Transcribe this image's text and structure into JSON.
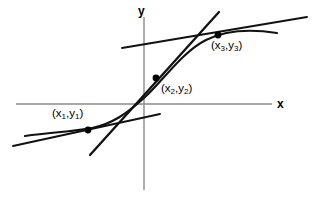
{
  "figure": {
    "width": 317,
    "height": 198,
    "background_color": "#ffffff"
  },
  "axes": {
    "x_axis": {
      "label": "x",
      "label_icon": "x-axis-label",
      "color": "#8b8b8b",
      "y_pixel": 104,
      "x_start": 16,
      "x_end": 272
    },
    "y_axis": {
      "label": "y",
      "label_icon": "y-axis-label",
      "color": "#8b8b8b",
      "x_pixel": 144,
      "y_start": 17,
      "y_end": 190
    }
  },
  "points": [
    {
      "id": "p1",
      "label_prefix": "(x",
      "label_sub1": "1",
      "label_mid": ",y",
      "label_sub2": "1",
      "label_suffix": ")",
      "label_text": "(x1,y1)",
      "cx": 88,
      "cy": 130,
      "r": 3.4
    },
    {
      "id": "p2",
      "label_prefix": "(x",
      "label_sub1": "2",
      "label_mid": ",y",
      "label_sub2": "2",
      "label_suffix": ")",
      "label_text": "(x2,y2)",
      "cx": 156,
      "cy": 78,
      "r": 3.4
    },
    {
      "id": "p3",
      "label_prefix": "(x",
      "label_sub1": "3",
      "label_mid": ",y",
      "label_sub2": "3",
      "label_suffix": ")",
      "label_text": "(x3,y3)",
      "cx": 218,
      "cy": 35,
      "r": 3.4
    }
  ],
  "chart_data": {
    "type": "line",
    "title": "",
    "xlabel": "x",
    "ylabel": "y",
    "grid": false,
    "legend": "none",
    "origin_pixel": [
      144,
      104
    ],
    "series": [
      {
        "name": "curve",
        "kind": "sigmoid-curve",
        "color": "#111111",
        "stroke_width": 2.1,
        "path": "M 25 136 C 52 132, 70 132, 92 128 C 112 124, 126 114, 144 98 C 162 82, 182 52, 206 40 C 228 29, 252 29, 277 33"
      },
      {
        "name": "secant-through-p1",
        "kind": "straight-line",
        "color": "#111111",
        "stroke_width": 1.9,
        "x1": 13,
        "y1": 146,
        "x2": 160,
        "y2": 114
      },
      {
        "name": "secant-through-p3",
        "kind": "straight-line",
        "color": "#111111",
        "stroke_width": 1.9,
        "x1": 122,
        "y1": 48,
        "x2": 307,
        "y2": 17
      },
      {
        "name": "steep-line-through-p2",
        "kind": "straight-line",
        "color": "#111111",
        "stroke_width": 2.3,
        "x1": 90,
        "y1": 155,
        "x2": 219,
        "y2": 12
      }
    ],
    "marked_points": [
      {
        "name": "(x1,y1)",
        "px": 88,
        "py": 130
      },
      {
        "name": "(x2,y2)",
        "px": 156,
        "py": 78
      },
      {
        "name": "(x3,y3)",
        "px": 218,
        "py": 35
      }
    ]
  }
}
